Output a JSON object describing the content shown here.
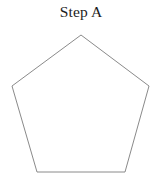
{
  "figure": {
    "caption": "Step A",
    "caption_color": "#1c1c1c",
    "background_color": "#ffffff",
    "width": 162,
    "height": 187
  },
  "shape": {
    "name": "pentagon",
    "sides": 5,
    "filled": false,
    "fill_color": "#ffffff",
    "stroke_color": "#8a8a8a",
    "stroke_width": 1,
    "vertices": [
      {
        "label": "apex",
        "x": 81,
        "y": 35
      },
      {
        "label": "upper-right",
        "x": 149,
        "y": 86
      },
      {
        "label": "lower-right",
        "x": 125,
        "y": 172
      },
      {
        "label": "lower-left",
        "x": 37,
        "y": 172
      },
      {
        "label": "upper-left",
        "x": 12,
        "y": 86
      }
    ],
    "points_attr": "81,35 149,86 125,172 37,172 12,86"
  }
}
